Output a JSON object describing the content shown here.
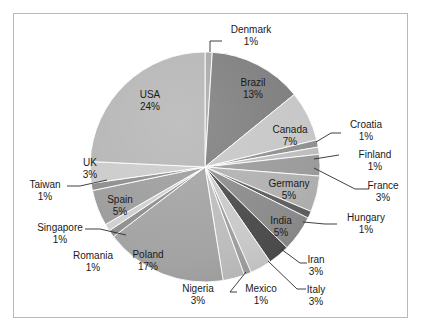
{
  "figure": {
    "background_color": "#ffffff",
    "frame_color": "#b9b9b9"
  },
  "chart_data": {
    "type": "pie",
    "title": "",
    "xlabel": "",
    "ylabel": "",
    "legend": "none",
    "grid": false,
    "start_angle_deg": 90,
    "direction": "clockwise",
    "units": "percent",
    "categories": [
      "Denmark",
      "Brazil",
      "Canada",
      "Croatia",
      "Finland",
      "France",
      "Germany",
      "Hungary",
      "India",
      "Iran",
      "Italy",
      "Mexico",
      "Nigeria",
      "Poland",
      "Romania",
      "Singapore",
      "Spain",
      "Taiwan",
      "UK",
      "USA"
    ],
    "values": [
      1,
      13,
      7,
      1,
      1,
      3,
      5,
      1,
      5,
      3,
      3,
      1,
      3,
      17,
      1,
      1,
      5,
      1,
      3,
      24
    ],
    "slices": [
      {
        "name": "Denmark",
        "value": 1,
        "label": "Denmark",
        "pct_label": "1%",
        "color": "#a8a8a8",
        "label_placement": "outside"
      },
      {
        "name": "Brazil",
        "value": 13,
        "label": "Brazil",
        "pct_label": "13%",
        "color": "#7c7c7c",
        "label_placement": "inside"
      },
      {
        "name": "Canada",
        "value": 7,
        "label": "Canada",
        "pct_label": "7%",
        "color": "#c6c6c6",
        "label_placement": "inside"
      },
      {
        "name": "Croatia",
        "value": 1,
        "label": "Croatia",
        "pct_label": "1%",
        "color": "#8f8f8f",
        "label_placement": "outside"
      },
      {
        "name": "Finland",
        "value": 1,
        "label": "Finland",
        "pct_label": "1%",
        "color": "#bdbdbd",
        "label_placement": "outside"
      },
      {
        "name": "France",
        "value": 3,
        "label": "France",
        "pct_label": "3%",
        "color": "#9a9a9a",
        "label_placement": "outside"
      },
      {
        "name": "Germany",
        "value": 5,
        "label": "Germany",
        "pct_label": "5%",
        "color": "#b0b0b0",
        "label_placement": "inside"
      },
      {
        "name": "Hungary",
        "value": 1,
        "label": "Hungary",
        "pct_label": "1%",
        "color": "#5d5d5d",
        "label_placement": "outside"
      },
      {
        "name": "India",
        "value": 5,
        "label": "India",
        "pct_label": "5%",
        "color": "#8a8a8a",
        "label_placement": "inside"
      },
      {
        "name": "Iran",
        "value": 3,
        "label": "Iran",
        "pct_label": "3%",
        "color": "#4a4a4a",
        "label_placement": "outside"
      },
      {
        "name": "Italy",
        "value": 3,
        "label": "Italy",
        "pct_label": "3%",
        "color": "#c9c9c9",
        "label_placement": "outside"
      },
      {
        "name": "Mexico",
        "value": 1,
        "label": "Mexico",
        "pct_label": "1%",
        "color": "#9e9e9e",
        "label_placement": "outside"
      },
      {
        "name": "Nigeria",
        "value": 3,
        "label": "Nigeria",
        "pct_label": "3%",
        "color": "#bcbcbc",
        "label_placement": "outside"
      },
      {
        "name": "Poland",
        "value": 17,
        "label": "Poland",
        "pct_label": "17%",
        "color": "#a2a2a2",
        "label_placement": "inside"
      },
      {
        "name": "Romania",
        "value": 1,
        "label": "Romania",
        "pct_label": "1%",
        "color": "#8d8d8d",
        "label_placement": "outside"
      },
      {
        "name": "Singapore",
        "value": 1,
        "label": "Singapore",
        "pct_label": "1%",
        "color": "#cfcfcf",
        "label_placement": "outside"
      },
      {
        "name": "Spain",
        "value": 5,
        "label": "Spain",
        "pct_label": "5%",
        "color": "#9b9b9b",
        "label_placement": "inside"
      },
      {
        "name": "Taiwan",
        "value": 1,
        "label": "Taiwan",
        "pct_label": "1%",
        "color": "#8b8b8b",
        "label_placement": "outside"
      },
      {
        "name": "UK",
        "value": 3,
        "label": "UK",
        "pct_label": "3%",
        "color": "#cacaca",
        "label_placement": "outside"
      },
      {
        "name": "USA",
        "value": 24,
        "label": "USA",
        "pct_label": "24%",
        "color": "#b4b4b4",
        "label_placement": "inside"
      }
    ]
  },
  "geometry": {
    "center_x": 205,
    "center_y": 167,
    "radius": 115
  },
  "label_positions": [
    {
      "name": "Denmark",
      "x": 251,
      "y": 30,
      "anchor": "middle",
      "leader": [
        [
          210,
          52
        ],
        [
          210,
          41
        ],
        [
          222,
          41
        ]
      ]
    },
    {
      "name": "Brazil",
      "x": 253,
      "y": 83,
      "anchor": "middle",
      "leader": null
    },
    {
      "name": "Canada",
      "x": 290,
      "y": 130,
      "anchor": "middle",
      "leader": null
    },
    {
      "name": "Croatia",
      "x": 366,
      "y": 125,
      "anchor": "middle",
      "leader": [
        [
          316,
          142
        ],
        [
          331,
          133
        ],
        [
          341,
          133
        ]
      ]
    },
    {
      "name": "Finland",
      "x": 375,
      "y": 155,
      "anchor": "middle",
      "leader": [
        [
          314,
          159
        ],
        [
          339,
          155
        ]
      ]
    },
    {
      "name": "France",
      "x": 383,
      "y": 186,
      "anchor": "middle",
      "leader": [
        [
          314,
          168
        ],
        [
          355,
          189
        ],
        [
          369,
          189
        ]
      ]
    },
    {
      "name": "Germany",
      "x": 289,
      "y": 184,
      "anchor": "middle",
      "leader": null
    },
    {
      "name": "Hungary",
      "x": 366,
      "y": 218,
      "anchor": "middle",
      "leader": [
        [
          303,
          222
        ],
        [
          325,
          224
        ],
        [
          337,
          224
        ]
      ]
    },
    {
      "name": "India",
      "x": 281,
      "y": 221,
      "anchor": "middle",
      "leader": null
    },
    {
      "name": "Iran",
      "x": 316,
      "y": 260,
      "anchor": "middle",
      "leader": [
        [
          281,
          249
        ],
        [
          300,
          263
        ],
        [
          307,
          263
        ]
      ]
    },
    {
      "name": "Italy",
      "x": 316,
      "y": 290,
      "anchor": "middle",
      "leader": [
        [
          268,
          261
        ],
        [
          297,
          289
        ],
        [
          306,
          289
        ]
      ]
    },
    {
      "name": "Mexico",
      "x": 261,
      "y": 289,
      "anchor": "middle",
      "leader": [
        [
          246,
          272
        ],
        [
          230,
          292
        ],
        [
          237,
          292
        ]
      ]
    },
    {
      "name": "Nigeria",
      "x": 198,
      "y": 289,
      "anchor": "middle",
      "leader": null
    },
    {
      "name": "Poland",
      "x": 148,
      "y": 255,
      "anchor": "middle",
      "leader": null
    },
    {
      "name": "Romania",
      "x": 93,
      "y": 256,
      "anchor": "middle",
      "leader": null
    },
    {
      "name": "Singapore",
      "x": 60,
      "y": 228,
      "anchor": "middle",
      "leader": [
        [
          126,
          235
        ],
        [
          100,
          229
        ],
        [
          85,
          229
        ]
      ]
    },
    {
      "name": "Spain",
      "x": 120,
      "y": 200,
      "anchor": "middle",
      "leader": null
    },
    {
      "name": "Taiwan",
      "x": 45,
      "y": 185,
      "anchor": "middle",
      "leader": [
        [
          107,
          180
        ],
        [
          80,
          186
        ],
        [
          67,
          186
        ]
      ]
    },
    {
      "name": "UK",
      "x": 90,
      "y": 163,
      "anchor": "middle",
      "leader": null
    }
  ],
  "usa_label_position": {
    "x": 150,
    "y": 95
  }
}
